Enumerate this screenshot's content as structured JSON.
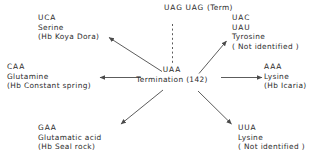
{
  "diagram": {
    "line_color": "#4a4a4a",
    "text_color": "#2b2b2b",
    "background": "#ffffff",
    "center": {
      "codon": "UAA",
      "label": "Termination",
      "position": "(142)"
    },
    "top_center": {
      "codon_line1": "UAG",
      "codon_line2": "UAG",
      "note": "(Term)"
    },
    "nodes": [
      {
        "id": "top-left",
        "codon": "UCA",
        "amino_acid": "Serine",
        "variant": "(Hb Koya Dora)"
      },
      {
        "id": "top-right",
        "codon": "UAC",
        "codon2": "UAU",
        "amino_acid": "Tyrosine",
        "variant": "( Not identified )"
      },
      {
        "id": "left",
        "codon": "CAA",
        "amino_acid": "Glutamine",
        "variant": "(Hb  Constant spring)"
      },
      {
        "id": "right",
        "codon": "AAA",
        "amino_acid": "Lysine",
        "variant": "(Hb Icaria)"
      },
      {
        "id": "bottom-left",
        "codon": "GAA",
        "amino_acid": "Glutamatic acid",
        "variant": "(Hb Seal rock)"
      },
      {
        "id": "bottom-right",
        "codon": "UUA",
        "amino_acid": "Lysine",
        "variant": "( Not identified )"
      }
    ]
  }
}
